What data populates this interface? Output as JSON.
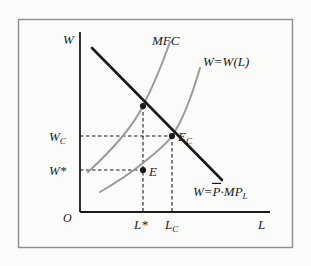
{
  "figure": {
    "kind": "economics-diagram",
    "topic": "Monopsony labor market equilibrium",
    "frame": {
      "border_color": "#8d8d8d",
      "background_color": "#fbfbfa"
    }
  },
  "axes": {
    "y_label": "W",
    "x_label": "L",
    "origin_label": "O",
    "axis_color": "#1a1a1a",
    "x_range_px": [
      80,
      270
    ],
    "y_range_px": [
      32,
      212
    ]
  },
  "y_ticks": [
    {
      "label": "W",
      "sub": "C",
      "star": "",
      "y_px": 136
    },
    {
      "label": "W",
      "sub": "",
      "star": "*",
      "y_px": 170
    }
  ],
  "x_ticks": [
    {
      "label": "L",
      "sub": "",
      "star": "*",
      "x_px": 143
    },
    {
      "label": "L",
      "sub": "C",
      "star": "",
      "x_px": 172
    }
  ],
  "curves": [
    {
      "name": "marginal-revenue-product",
      "label": "W=",
      "label_parts": {
        "lhs": "W=",
        "overbar": "P",
        "dot": "·",
        "rhs": "MP",
        "rhs_sub": "L"
      },
      "color": "#1a1a1a",
      "width": 2.6,
      "style": "solid",
      "shape": "line",
      "points_px": [
        [
          92,
          48
        ],
        [
          222,
          180
        ]
      ]
    },
    {
      "name": "marginal-factor-cost",
      "label": "MFC",
      "color": "#9a9a9a",
      "width": 2.0,
      "style": "solid",
      "shape": "convex-increasing",
      "points_px": [
        [
          88,
          172
        ],
        [
          110,
          152
        ],
        [
          128,
          128
        ],
        [
          143,
          106
        ],
        [
          156,
          80
        ],
        [
          166,
          56
        ],
        [
          170,
          42
        ]
      ]
    },
    {
      "name": "labor-supply",
      "label": "W=W(L)",
      "color": "#9a9a9a",
      "width": 2.0,
      "style": "solid",
      "shape": "convex-increasing",
      "points_px": [
        [
          100,
          192
        ],
        [
          122,
          178
        ],
        [
          143,
          163
        ],
        [
          160,
          149
        ],
        [
          172,
          136
        ],
        [
          186,
          110
        ],
        [
          195,
          85
        ],
        [
          200,
          68
        ]
      ]
    }
  ],
  "curve_labels": [
    {
      "name": "mfc-label",
      "text": "MFC",
      "x_px": 152,
      "y_px": 45
    },
    {
      "name": "supply-label",
      "text": "W=W(L)",
      "x_px": 205,
      "y_px": 66
    }
  ],
  "points": [
    {
      "name": "mfc-intersection",
      "label": "",
      "x_px": 143,
      "y_px": 106,
      "filled": true
    },
    {
      "name": "competitive-equilibrium",
      "label": "E",
      "sub": "C",
      "x_px": 172,
      "y_px": 136,
      "filled": true,
      "label_x_px": 179,
      "label_y_px": 139
    },
    {
      "name": "monopsony-equilibrium",
      "label": "E",
      "sub": "",
      "x_px": 143,
      "y_px": 170,
      "filled": true,
      "label_x_px": 150,
      "label_y_px": 175
    }
  ],
  "guide_lines": [
    {
      "name": "wc-guide",
      "from_px": [
        80,
        136
      ],
      "to_px": [
        172,
        136
      ],
      "orientation": "horizontal"
    },
    {
      "name": "wstar-guide",
      "from_px": [
        80,
        170
      ],
      "to_px": [
        143,
        170
      ],
      "orientation": "horizontal"
    },
    {
      "name": "lstar-guide",
      "from_px": [
        143,
        106
      ],
      "to_px": [
        143,
        212
      ],
      "orientation": "vertical"
    },
    {
      "name": "lc-guide",
      "from_px": [
        172,
        136
      ],
      "to_px": [
        172,
        212
      ],
      "orientation": "vertical"
    }
  ],
  "guide_style": {
    "color": "#1a1a1a",
    "dash": "3.5,2.5",
    "width": 1.1
  }
}
